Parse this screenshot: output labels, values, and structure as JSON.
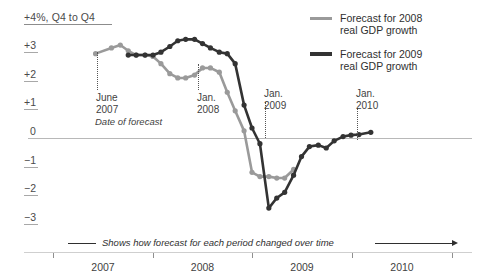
{
  "axis": {
    "y_unit_label": "+4%, Q4 to Q4",
    "y_ticks": [
      {
        "label": "+4%, Q4 to Q4",
        "value": 4
      },
      {
        "label": "+3",
        "value": 3
      },
      {
        "label": "+2",
        "value": 2
      },
      {
        "label": "+1",
        "value": 1
      },
      {
        "label": "0",
        "value": 0
      },
      {
        "label": "−1",
        "value": -1
      },
      {
        "label": "−2",
        "value": -2
      },
      {
        "label": "−3",
        "value": -3
      }
    ],
    "x_ticks": [
      {
        "label": "2007",
        "value": 2007
      },
      {
        "label": "2008",
        "value": 2008
      },
      {
        "label": "2009",
        "value": 2009
      },
      {
        "label": "2010",
        "value": 2010
      }
    ]
  },
  "annotations": [
    {
      "line1": "June",
      "line2": "2007",
      "sub": "Date of forecast"
    },
    {
      "line1": "Jan.",
      "line2": "2008",
      "sub": ""
    },
    {
      "line1": "Jan.",
      "line2": "2009",
      "sub": ""
    },
    {
      "line1": "Jan.",
      "line2": "2010",
      "sub": ""
    }
  ],
  "legend": [
    {
      "label_line1": "Forecast for 2008",
      "label_line2": "real GDP growth",
      "color": "#9a9a9a"
    },
    {
      "label_line1": "Forecast for 2009",
      "label_line2": "real GDP growth",
      "color": "#333333"
    }
  ],
  "caption": {
    "text": "Shows how forecast for each period changed over time"
  },
  "colors": {
    "series_2008": "#9a9a9a",
    "series_2009": "#333333",
    "zero_line": "#b8b8b8",
    "axis": "#8f8f8f",
    "text": "#3a3a3a",
    "background": "#ffffff"
  },
  "chart_data": {
    "type": "line",
    "title": "",
    "subtitle": "",
    "xlabel": "Date of forecast",
    "ylabel": "+4%, Q4 to Q4",
    "xlim": [
      2006.8,
      2010.45
    ],
    "ylim": [
      -3.4,
      4.0
    ],
    "grid": false,
    "legend_position": "top-right",
    "series": [
      {
        "name": "Forecast for 2008 real GDP growth",
        "color": "#9a9a9a",
        "points": [
          {
            "x": 2007.42,
            "y": 2.95
          },
          {
            "x": 2007.58,
            "y": 3.15
          },
          {
            "x": 2007.67,
            "y": 3.25
          },
          {
            "x": 2007.75,
            "y": 3.05
          },
          {
            "x": 2007.83,
            "y": 2.9
          },
          {
            "x": 2007.92,
            "y": 2.9
          },
          {
            "x": 2008.0,
            "y": 2.85
          },
          {
            "x": 2008.08,
            "y": 2.6
          },
          {
            "x": 2008.17,
            "y": 2.25
          },
          {
            "x": 2008.25,
            "y": 2.1
          },
          {
            "x": 2008.33,
            "y": 2.1
          },
          {
            "x": 2008.42,
            "y": 2.2
          },
          {
            "x": 2008.5,
            "y": 2.45
          },
          {
            "x": 2008.58,
            "y": 2.45
          },
          {
            "x": 2008.67,
            "y": 2.3
          },
          {
            "x": 2008.75,
            "y": 1.6
          },
          {
            "x": 2008.83,
            "y": 0.95
          },
          {
            "x": 2008.92,
            "y": 0.25
          },
          {
            "x": 2009.0,
            "y": -1.2
          },
          {
            "x": 2009.08,
            "y": -1.35
          },
          {
            "x": 2009.17,
            "y": -1.35
          },
          {
            "x": 2009.25,
            "y": -1.4
          },
          {
            "x": 2009.33,
            "y": -1.4
          },
          {
            "x": 2009.42,
            "y": -1.1
          }
        ]
      },
      {
        "name": "Forecast for 2009 real GDP growth",
        "color": "#333333",
        "points": [
          {
            "x": 2007.75,
            "y": 2.9
          },
          {
            "x": 2007.83,
            "y": 2.9
          },
          {
            "x": 2007.92,
            "y": 2.9
          },
          {
            "x": 2008.0,
            "y": 2.9
          },
          {
            "x": 2008.08,
            "y": 3.0
          },
          {
            "x": 2008.17,
            "y": 3.2
          },
          {
            "x": 2008.25,
            "y": 3.4
          },
          {
            "x": 2008.33,
            "y": 3.45
          },
          {
            "x": 2008.42,
            "y": 3.45
          },
          {
            "x": 2008.5,
            "y": 3.3
          },
          {
            "x": 2008.58,
            "y": 3.15
          },
          {
            "x": 2008.67,
            "y": 3.0
          },
          {
            "x": 2008.75,
            "y": 2.95
          },
          {
            "x": 2008.83,
            "y": 2.6
          },
          {
            "x": 2008.92,
            "y": 1.15
          },
          {
            "x": 2009.0,
            "y": 0.35
          },
          {
            "x": 2009.08,
            "y": -0.2
          },
          {
            "x": 2009.17,
            "y": -2.45
          },
          {
            "x": 2009.25,
            "y": -2.1
          },
          {
            "x": 2009.33,
            "y": -1.9
          },
          {
            "x": 2009.42,
            "y": -1.3
          },
          {
            "x": 2009.5,
            "y": -0.65
          },
          {
            "x": 2009.58,
            "y": -0.3
          },
          {
            "x": 2009.67,
            "y": -0.25
          },
          {
            "x": 2009.75,
            "y": -0.35
          },
          {
            "x": 2009.83,
            "y": -0.1
          },
          {
            "x": 2009.92,
            "y": 0.05
          },
          {
            "x": 2010.0,
            "y": 0.1
          },
          {
            "x": 2010.08,
            "y": 0.12
          },
          {
            "x": 2010.2,
            "y": 0.2
          }
        ]
      }
    ]
  }
}
